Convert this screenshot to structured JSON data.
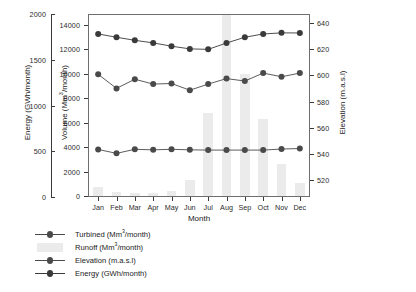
{
  "chart_data": {
    "type": "line",
    "title": "",
    "xlabel": "Month",
    "categories": [
      "Jan",
      "Feb",
      "Mar",
      "Apr",
      "May",
      "Jun",
      "Jul",
      "Aug",
      "Sep",
      "Oct",
      "Nov",
      "Dec"
    ],
    "grid": false,
    "legend_position": "below-left",
    "axes": {
      "left_outer": {
        "label": "Energy (GWh/month)",
        "ticks": [
          0,
          500,
          1000,
          1500,
          2000
        ],
        "lim": [
          0,
          2000
        ],
        "unit": "GWh/month"
      },
      "left_inner": {
        "label": "Volume (Mm3/month)",
        "label_html": "Volume (Mm<sup>3</sup>/month)",
        "ticks": [
          0,
          2000,
          4000,
          6000,
          8000,
          10000,
          12000,
          14000
        ],
        "lim": [
          0,
          14800
        ],
        "unit": "Mm3/month"
      },
      "right": {
        "label": "Elevation (m.a.s.l)",
        "ticks": [
          520,
          540,
          560,
          580,
          600,
          620,
          640
        ],
        "lim": [
          508,
          646
        ],
        "unit": "m.a.s.l"
      }
    },
    "series": [
      {
        "name": "Turbined (Mm3/month)",
        "name_html": "Turbined (Mm<sup>3</sup>/month)",
        "axis": "left_inner",
        "style": "line-marker",
        "color": "#4a4a4a",
        "values": [
          9950,
          8800,
          9550,
          9150,
          9200,
          8650,
          9150,
          9600,
          9400,
          10050,
          9750,
          10050
        ]
      },
      {
        "name": "Runoff  (Mm3/month)",
        "name_html": "Runoff  (Mm<sup>3</sup>/month)",
        "axis": "left_inner",
        "style": "bar",
        "color": "#ebebeb",
        "values": [
          700,
          350,
          280,
          260,
          450,
          1300,
          6800,
          14800,
          10000,
          6300,
          2600,
          1100
        ]
      },
      {
        "name": "Elevation (m.a.s.l)",
        "axis": "right",
        "style": "line-marker",
        "color": "#4a4a4a",
        "values": [
          543.5,
          540.5,
          543.6,
          543.2,
          543.6,
          543.2,
          543.0,
          543.0,
          543.0,
          543.0,
          543.8,
          544.2
        ]
      },
      {
        "name": "Energy (GWh/month)",
        "axis": "left_outer",
        "style": "line-marker",
        "color": "#3a3a3a",
        "values": [
          1790,
          1755,
          1720,
          1690,
          1655,
          1625,
          1620,
          1690,
          1755,
          1790,
          1805,
          1805
        ],
        "plot_values_on_volume_scale": [
          13250,
          12980,
          12730,
          12520,
          12250,
          12030,
          11990,
          12510,
          12980,
          13250,
          13340,
          13330
        ]
      }
    ]
  },
  "legend": {
    "items": [
      {
        "label": "Turbined (Mm3/month)",
        "marker": "line-dot"
      },
      {
        "label": "Runoff  (Mm3/month)",
        "marker": "swatch"
      },
      {
        "label": "Elevation (m.a.s.l)",
        "marker": "line-dot"
      },
      {
        "label": "Energy (GWh/month)",
        "marker": "line-dot"
      }
    ]
  }
}
